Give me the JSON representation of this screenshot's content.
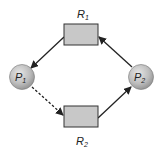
{
  "diagram": {
    "type": "resource-allocation-graph",
    "processes": [
      {
        "id": "P1",
        "label": "P",
        "sub": "1"
      },
      {
        "id": "P2",
        "label": "P",
        "sub": "2"
      }
    ],
    "resources": [
      {
        "id": "R1",
        "label": "R",
        "sub": "1"
      },
      {
        "id": "R2",
        "label": "R",
        "sub": "2"
      }
    ],
    "edges": [
      {
        "from": "R1",
        "to": "P1",
        "style": "solid",
        "kind": "assignment"
      },
      {
        "from": "P1",
        "to": "R2",
        "style": "dashed",
        "kind": "claim"
      },
      {
        "from": "R2",
        "to": "P2",
        "style": "solid",
        "kind": "assignment"
      },
      {
        "from": "P2",
        "to": "R1",
        "style": "solid",
        "kind": "request"
      }
    ],
    "colors": {
      "process_fill": "#bdbdbd",
      "resource_fill": "#c8c8c8",
      "stroke": "#222222"
    }
  }
}
